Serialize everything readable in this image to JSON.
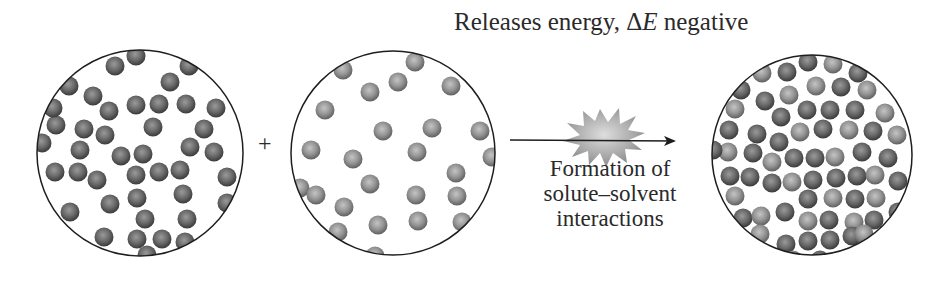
{
  "header": {
    "title_prefix": "Releases energy, ",
    "delta_symbol": "Δ",
    "energy_symbol": "E",
    "title_suffix": " negative"
  },
  "operator": {
    "plus": "+"
  },
  "process": {
    "line1": "Formation of",
    "line2": "solute–solvent",
    "line3": "interactions",
    "icon": "energy-burst-icon"
  },
  "colors": {
    "solute": "#5a5a5a",
    "solvent": "#8c8c8c",
    "outline": "#1e1e1e",
    "burst": "#a8a8a8"
  },
  "panels": [
    {
      "name": "solute-particles",
      "cx": 140,
      "cy": 153,
      "r": 103,
      "particles": [
        [
          136,
          56,
          "a"
        ],
        [
          115,
          66,
          "a"
        ],
        [
          189,
          66,
          "a"
        ],
        [
          170,
          82,
          "a"
        ],
        [
          69,
          86,
          "a"
        ],
        [
          93,
          96,
          "a"
        ],
        [
          109,
          111,
          "a"
        ],
        [
          136,
          105,
          "a"
        ],
        [
          159,
          104,
          "a"
        ],
        [
          186,
          104,
          "a"
        ],
        [
          216,
          108,
          "a"
        ],
        [
          56,
          125,
          "a"
        ],
        [
          84,
          129,
          "a"
        ],
        [
          105,
          135,
          "a"
        ],
        [
          153,
          127,
          "a"
        ],
        [
          204,
          129,
          "a"
        ],
        [
          80,
          150,
          "a"
        ],
        [
          121,
          156,
          "a"
        ],
        [
          143,
          154,
          "a"
        ],
        [
          190,
          147,
          "a"
        ],
        [
          214,
          152,
          "a"
        ],
        [
          42,
          143,
          "a"
        ],
        [
          55,
          172,
          "a"
        ],
        [
          78,
          172,
          "a"
        ],
        [
          97,
          180,
          "a"
        ],
        [
          136,
          175,
          "a"
        ],
        [
          159,
          172,
          "a"
        ],
        [
          180,
          170,
          "a"
        ],
        [
          227,
          177,
          "a"
        ],
        [
          137,
          198,
          "a"
        ],
        [
          183,
          194,
          "a"
        ],
        [
          110,
          204,
          "a"
        ],
        [
          70,
          212,
          "a"
        ],
        [
          145,
          219,
          "a"
        ],
        [
          187,
          219,
          "a"
        ],
        [
          104,
          237,
          "a"
        ],
        [
          137,
          239,
          "a"
        ],
        [
          162,
          239,
          "a"
        ],
        [
          185,
          242,
          "a"
        ],
        [
          147,
          255,
          "a"
        ],
        [
          227,
          203,
          "a"
        ],
        [
          203,
          54,
          "a"
        ],
        [
          53,
          108,
          "a"
        ],
        [
          40,
          206,
          "a"
        ]
      ]
    },
    {
      "name": "solvent-particles",
      "cx": 393,
      "cy": 153,
      "r": 102,
      "particles": [
        [
          343,
          70,
          "b"
        ],
        [
          415,
          62,
          "b"
        ],
        [
          398,
          82,
          "b"
        ],
        [
          370,
          92,
          "b"
        ],
        [
          451,
          86,
          "b"
        ],
        [
          325,
          110,
          "b"
        ],
        [
          383,
          131,
          "b"
        ],
        [
          432,
          128,
          "b"
        ],
        [
          480,
          131,
          "b"
        ],
        [
          311,
          150,
          "b"
        ],
        [
          353,
          159,
          "b"
        ],
        [
          417,
          152,
          "b"
        ],
        [
          492,
          157,
          "b"
        ],
        [
          456,
          173,
          "b"
        ],
        [
          370,
          184,
          "b"
        ],
        [
          300,
          188,
          "b"
        ],
        [
          316,
          195,
          "b"
        ],
        [
          416,
          195,
          "b"
        ],
        [
          457,
          196,
          "b"
        ],
        [
          344,
          207,
          "b"
        ],
        [
          338,
          232,
          "b"
        ],
        [
          378,
          225,
          "b"
        ],
        [
          418,
          221,
          "b"
        ],
        [
          462,
          222,
          "b"
        ],
        [
          375,
          256,
          "b"
        ]
      ]
    },
    {
      "name": "solution-mixture",
      "cx": 812,
      "cy": 155,
      "r": 100,
      "particles": [
        [
          808,
          62,
          "a"
        ],
        [
          833,
          64,
          "b"
        ],
        [
          762,
          73,
          "b"
        ],
        [
          787,
          72,
          "a"
        ],
        [
          858,
          73,
          "a"
        ],
        [
          741,
          90,
          "a"
        ],
        [
          816,
          86,
          "b"
        ],
        [
          841,
          87,
          "a"
        ],
        [
          867,
          90,
          "b"
        ],
        [
          765,
          101,
          "a"
        ],
        [
          789,
          95,
          "b"
        ],
        [
          735,
          109,
          "b"
        ],
        [
          781,
          117,
          "a"
        ],
        [
          807,
          110,
          "a"
        ],
        [
          830,
          110,
          "a"
        ],
        [
          855,
          110,
          "a"
        ],
        [
          885,
          113,
          "b"
        ],
        [
          729,
          130,
          "a"
        ],
        [
          757,
          134,
          "a"
        ],
        [
          800,
          132,
          "b"
        ],
        [
          823,
          129,
          "a"
        ],
        [
          849,
          130,
          "b"
        ],
        [
          873,
          131,
          "a"
        ],
        [
          897,
          135,
          "b"
        ],
        [
          779,
          142,
          "a"
        ],
        [
          728,
          152,
          "b"
        ],
        [
          753,
          153,
          "a"
        ],
        [
          772,
          162,
          "b"
        ],
        [
          794,
          158,
          "a"
        ],
        [
          815,
          158,
          "a"
        ],
        [
          835,
          157,
          "b"
        ],
        [
          862,
          152,
          "a"
        ],
        [
          888,
          158,
          "a"
        ],
        [
          713,
          150,
          "a"
        ],
        [
          730,
          176,
          "a"
        ],
        [
          750,
          177,
          "a"
        ],
        [
          772,
          183,
          "a"
        ],
        [
          792,
          182,
          "b"
        ],
        [
          813,
          180,
          "a"
        ],
        [
          836,
          178,
          "a"
        ],
        [
          857,
          176,
          "a"
        ],
        [
          875,
          175,
          "b"
        ],
        [
          898,
          181,
          "a"
        ],
        [
          735,
          196,
          "b"
        ],
        [
          808,
          199,
          "a"
        ],
        [
          833,
          198,
          "b"
        ],
        [
          855,
          199,
          "a"
        ],
        [
          876,
          198,
          "b"
        ],
        [
          743,
          218,
          "a"
        ],
        [
          761,
          216,
          "b"
        ],
        [
          785,
          212,
          "a"
        ],
        [
          808,
          221,
          "b"
        ],
        [
          829,
          220,
          "a"
        ],
        [
          854,
          222,
          "b"
        ],
        [
          874,
          220,
          "a"
        ],
        [
          898,
          212,
          "a"
        ],
        [
          760,
          234,
          "b"
        ],
        [
          786,
          244,
          "a"
        ],
        [
          808,
          241,
          "a"
        ],
        [
          830,
          240,
          "a"
        ],
        [
          852,
          236,
          "a"
        ],
        [
          864,
          234,
          "b"
        ],
        [
          793,
          260,
          "b"
        ],
        [
          820,
          260,
          "a"
        ]
      ]
    }
  ]
}
